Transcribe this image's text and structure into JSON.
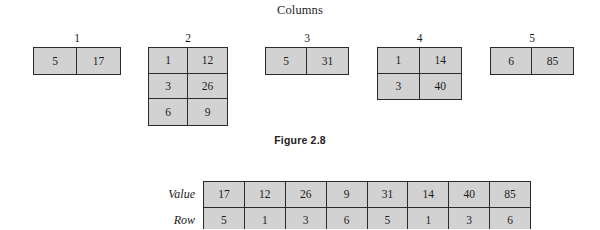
{
  "figure": {
    "heading": "Columns",
    "caption": "Figure 2.8"
  },
  "columns": [
    {
      "number": "1",
      "left": 33,
      "top": 47,
      "width": 88,
      "rows": [
        {
          "row": "5",
          "value": "17"
        }
      ]
    },
    {
      "number": "2",
      "left": 148,
      "top": 47,
      "width": 80,
      "rows": [
        {
          "row": "1",
          "value": "12"
        },
        {
          "row": "3",
          "value": "26"
        },
        {
          "row": "6",
          "value": "9"
        }
      ]
    },
    {
      "number": "3",
      "left": 265,
      "top": 47,
      "width": 84,
      "rows": [
        {
          "row": "5",
          "value": "31"
        }
      ]
    },
    {
      "number": "4",
      "left": 377,
      "top": 47,
      "width": 85,
      "rows": [
        {
          "row": "1",
          "value": "14"
        },
        {
          "row": "3",
          "value": "40"
        }
      ]
    },
    {
      "number": "5",
      "left": 490,
      "top": 47,
      "width": 84,
      "rows": [
        {
          "row": "6",
          "value": "85"
        }
      ]
    }
  ],
  "bottom_table": {
    "rows": [
      {
        "label": "Value",
        "cells": [
          "17",
          "12",
          "26",
          "9",
          "31",
          "14",
          "40",
          "85"
        ]
      },
      {
        "label": "Row",
        "cells": [
          "5",
          "1",
          "3",
          "6",
          "5",
          "1",
          "3",
          "6"
        ]
      }
    ]
  },
  "colors": {
    "cell_fill": "#d2d2d2",
    "border": "#2a2a2a",
    "text": "#1c1c1c",
    "background": "#ffffff"
  }
}
